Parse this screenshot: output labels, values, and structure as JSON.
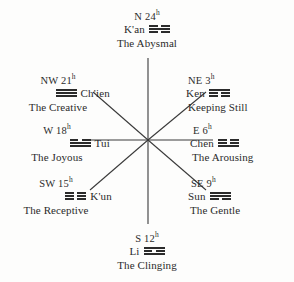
{
  "diagram": {
    "hub": {
      "x": 148,
      "y": 140
    },
    "line_color": "#3a3a3a",
    "text_color": "#2b2b2b",
    "background": "#fdfdfc"
  },
  "nodes": [
    {
      "id": "n",
      "direction": "N",
      "hour": "24",
      "hour_unit": "h",
      "name": "K'an",
      "description": "The Abysmal",
      "trigram": [
        "broken",
        "solid",
        "broken"
      ],
      "glyph": "☵"
    },
    {
      "id": "ne",
      "direction": "NE",
      "hour": "3",
      "hour_unit": "h",
      "name": "Ken",
      "description": "Keeping Still",
      "trigram": [
        "solid",
        "broken",
        "broken"
      ],
      "glyph": "☶"
    },
    {
      "id": "e",
      "direction": "E",
      "hour": "6",
      "hour_unit": "h",
      "name": "Chen",
      "description": "The Arousing",
      "trigram": [
        "broken",
        "broken",
        "solid"
      ],
      "glyph": "☳"
    },
    {
      "id": "se",
      "direction": "SE",
      "hour": "9",
      "hour_unit": "h",
      "name": "Sun",
      "description": "The Gentle",
      "trigram": [
        "solid",
        "solid",
        "broken"
      ],
      "glyph": "☴"
    },
    {
      "id": "s",
      "direction": "S",
      "hour": "12",
      "hour_unit": "h",
      "name": "Li",
      "description": "The Clinging",
      "trigram": [
        "solid",
        "broken",
        "solid"
      ],
      "glyph": "☲"
    },
    {
      "id": "sw",
      "direction": "SW",
      "hour": "15",
      "hour_unit": "h",
      "name": "K'un",
      "description": "The Receptive",
      "trigram": [
        "broken",
        "broken",
        "broken"
      ],
      "glyph": "☷"
    },
    {
      "id": "w",
      "direction": "W",
      "hour": "18",
      "hour_unit": "h",
      "name": "Tui",
      "description": "The Joyous",
      "trigram": [
        "broken",
        "solid",
        "solid"
      ],
      "glyph": "☱"
    },
    {
      "id": "nw",
      "direction": "NW",
      "hour": "21",
      "hour_unit": "h",
      "name": "Ch'ien",
      "description": "The Creative",
      "trigram": [
        "solid",
        "solid",
        "solid"
      ],
      "glyph": "☰"
    }
  ],
  "spokes": [
    {
      "name": "spoke-n",
      "x1": 148,
      "y1": 140,
      "x2": 148,
      "y2": 58
    },
    {
      "name": "spoke-ne",
      "x1": 148,
      "y1": 140,
      "x2": 206,
      "y2": 92
    },
    {
      "name": "spoke-e",
      "x1": 148,
      "y1": 140,
      "x2": 213,
      "y2": 140
    },
    {
      "name": "spoke-se",
      "x1": 148,
      "y1": 140,
      "x2": 206,
      "y2": 190
    },
    {
      "name": "spoke-s",
      "x1": 148,
      "y1": 140,
      "x2": 148,
      "y2": 224
    },
    {
      "name": "spoke-sw",
      "x1": 148,
      "y1": 140,
      "x2": 90,
      "y2": 190
    },
    {
      "name": "spoke-w",
      "x1": 148,
      "y1": 140,
      "x2": 83,
      "y2": 140
    },
    {
      "name": "spoke-nw",
      "x1": 148,
      "y1": 140,
      "x2": 93,
      "y2": 92
    }
  ]
}
